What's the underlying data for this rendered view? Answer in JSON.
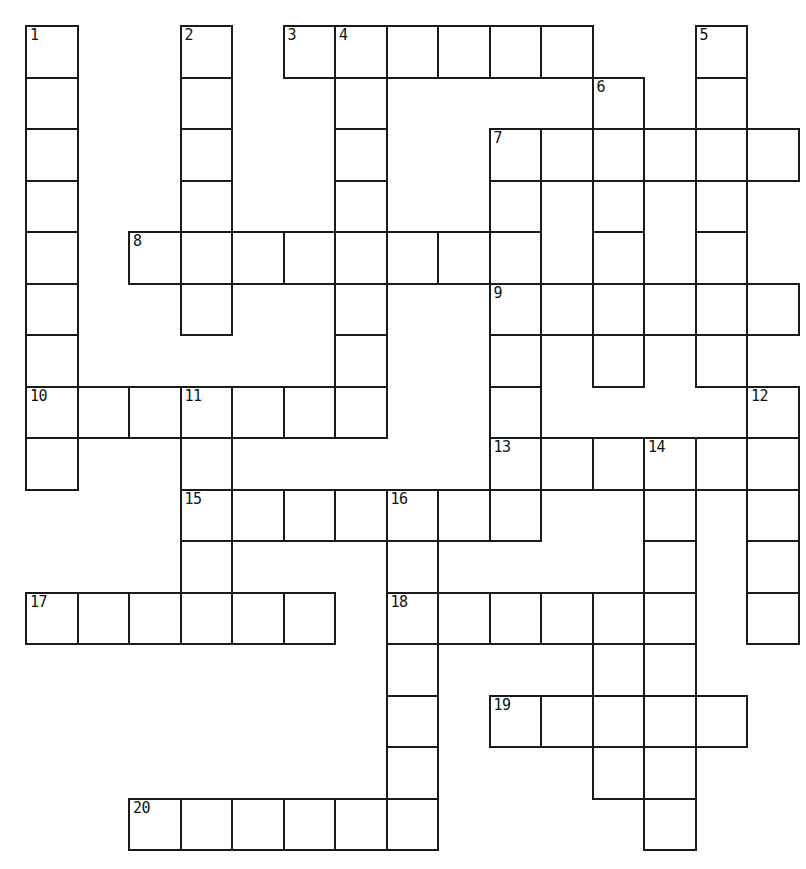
{
  "puzzle": {
    "title": "Crossword Puzzle Grid",
    "type": "crossword-grid",
    "grid": {
      "columns": 15,
      "rows": 16,
      "cell_size_px": 51.5,
      "origin_x_px": 25,
      "origin_y_px": 25,
      "cell_fill_color": "#ffffff",
      "cell_border_color": "#1a1a1a",
      "background_color": "#ffffff",
      "number_color": "#111111"
    },
    "entries": [
      {
        "number": "1",
        "direction": "down",
        "row": 1,
        "col": 1,
        "length": 8
      },
      {
        "number": "2",
        "direction": "down",
        "row": 1,
        "col": 4,
        "length": 7
      },
      {
        "number": "3",
        "direction": "across",
        "row": 1,
        "col": 6,
        "length": 6
      },
      {
        "number": "4",
        "direction": "down",
        "row": 1,
        "col": 7,
        "length": 9
      },
      {
        "number": "5",
        "direction": "down",
        "row": 1,
        "col": 14,
        "length": 8
      },
      {
        "number": "6",
        "direction": "down",
        "row": 2,
        "col": 12,
        "length": 8
      },
      {
        "number": "7",
        "direction": "across",
        "row": 3,
        "col": 10,
        "length": 6
      },
      {
        "number": "8",
        "direction": "across",
        "row": 5,
        "col": 3,
        "length": 7
      },
      {
        "number": "9",
        "direction": "across",
        "row": 6,
        "col": 10,
        "length": 6
      },
      {
        "number": "10",
        "direction": "across",
        "row": 8,
        "col": 1,
        "length": 7
      },
      {
        "number": "11",
        "direction": "down",
        "row": 8,
        "col": 4,
        "length": 6
      },
      {
        "number": "12",
        "direction": "down",
        "row": 8,
        "col": 15,
        "length": 5
      },
      {
        "number": "13",
        "direction": "across",
        "row": 9,
        "col": 10,
        "length": 5
      },
      {
        "number": "14",
        "direction": "down",
        "row": 9,
        "col": 13,
        "length": 8
      },
      {
        "number": "15",
        "direction": "across",
        "row": 10,
        "col": 4,
        "length": 5
      },
      {
        "number": "16",
        "direction": "down",
        "row": 10,
        "col": 8,
        "length": 7
      },
      {
        "number": "17",
        "direction": "across",
        "row": 12,
        "col": 1,
        "length": 6
      },
      {
        "number": "18",
        "direction": "across",
        "row": 12,
        "col": 8,
        "length": 5
      },
      {
        "number": "19",
        "direction": "across",
        "row": 14,
        "col": 10,
        "length": 5
      },
      {
        "number": "20",
        "direction": "across",
        "row": 16,
        "col": 3,
        "length": 6
      }
    ],
    "cells": [
      {
        "row": 1,
        "col": 1,
        "number": "1",
        "letter": ""
      },
      {
        "row": 1,
        "col": 4,
        "number": "2",
        "letter": ""
      },
      {
        "row": 1,
        "col": 6,
        "number": "3",
        "letter": ""
      },
      {
        "row": 1,
        "col": 7,
        "number": "4",
        "letter": ""
      },
      {
        "row": 1,
        "col": 8,
        "number": "",
        "letter": ""
      },
      {
        "row": 1,
        "col": 9,
        "number": "",
        "letter": ""
      },
      {
        "row": 1,
        "col": 10,
        "number": "",
        "letter": ""
      },
      {
        "row": 1,
        "col": 11,
        "number": "",
        "letter": ""
      },
      {
        "row": 1,
        "col": 14,
        "number": "5",
        "letter": ""
      },
      {
        "row": 2,
        "col": 1,
        "number": "",
        "letter": ""
      },
      {
        "row": 2,
        "col": 4,
        "number": "",
        "letter": ""
      },
      {
        "row": 2,
        "col": 7,
        "number": "",
        "letter": ""
      },
      {
        "row": 2,
        "col": 12,
        "number": "6",
        "letter": ""
      },
      {
        "row": 2,
        "col": 14,
        "number": "",
        "letter": ""
      },
      {
        "row": 3,
        "col": 1,
        "number": "",
        "letter": ""
      },
      {
        "row": 3,
        "col": 4,
        "number": "",
        "letter": ""
      },
      {
        "row": 3,
        "col": 7,
        "number": "",
        "letter": ""
      },
      {
        "row": 3,
        "col": 10,
        "number": "7",
        "letter": ""
      },
      {
        "row": 3,
        "col": 11,
        "number": "",
        "letter": ""
      },
      {
        "row": 3,
        "col": 12,
        "number": "",
        "letter": ""
      },
      {
        "row": 3,
        "col": 13,
        "number": "",
        "letter": ""
      },
      {
        "row": 3,
        "col": 14,
        "number": "",
        "letter": ""
      },
      {
        "row": 3,
        "col": 15,
        "number": "",
        "letter": ""
      },
      {
        "row": 4,
        "col": 1,
        "number": "",
        "letter": ""
      },
      {
        "row": 4,
        "col": 4,
        "number": "",
        "letter": ""
      },
      {
        "row": 4,
        "col": 7,
        "number": "",
        "letter": ""
      },
      {
        "row": 4,
        "col": 10,
        "number": "",
        "letter": ""
      },
      {
        "row": 4,
        "col": 12,
        "number": "",
        "letter": ""
      },
      {
        "row": 4,
        "col": 14,
        "number": "",
        "letter": ""
      },
      {
        "row": 5,
        "col": 1,
        "number": "",
        "letter": ""
      },
      {
        "row": 5,
        "col": 3,
        "number": "8",
        "letter": ""
      },
      {
        "row": 5,
        "col": 4,
        "number": "",
        "letter": ""
      },
      {
        "row": 5,
        "col": 5,
        "number": "",
        "letter": ""
      },
      {
        "row": 5,
        "col": 6,
        "number": "",
        "letter": ""
      },
      {
        "row": 5,
        "col": 7,
        "number": "",
        "letter": ""
      },
      {
        "row": 5,
        "col": 8,
        "number": "",
        "letter": ""
      },
      {
        "row": 5,
        "col": 9,
        "number": "",
        "letter": ""
      },
      {
        "row": 5,
        "col": 10,
        "number": "",
        "letter": ""
      },
      {
        "row": 5,
        "col": 12,
        "number": "",
        "letter": ""
      },
      {
        "row": 5,
        "col": 14,
        "number": "",
        "letter": ""
      },
      {
        "row": 6,
        "col": 1,
        "number": "",
        "letter": ""
      },
      {
        "row": 6,
        "col": 4,
        "number": "",
        "letter": ""
      },
      {
        "row": 6,
        "col": 7,
        "number": "",
        "letter": ""
      },
      {
        "row": 6,
        "col": 10,
        "number": "9",
        "letter": ""
      },
      {
        "row": 6,
        "col": 11,
        "number": "",
        "letter": ""
      },
      {
        "row": 6,
        "col": 12,
        "number": "",
        "letter": ""
      },
      {
        "row": 6,
        "col": 13,
        "number": "",
        "letter": ""
      },
      {
        "row": 6,
        "col": 14,
        "number": "",
        "letter": ""
      },
      {
        "row": 6,
        "col": 15,
        "number": "",
        "letter": ""
      },
      {
        "row": 7,
        "col": 1,
        "number": "",
        "letter": ""
      },
      {
        "row": 7,
        "col": 7,
        "number": "",
        "letter": ""
      },
      {
        "row": 7,
        "col": 10,
        "number": "",
        "letter": ""
      },
      {
        "row": 7,
        "col": 12,
        "number": "",
        "letter": ""
      },
      {
        "row": 7,
        "col": 14,
        "number": "",
        "letter": ""
      },
      {
        "row": 8,
        "col": 1,
        "number": "10",
        "letter": ""
      },
      {
        "row": 8,
        "col": 2,
        "number": "",
        "letter": ""
      },
      {
        "row": 8,
        "col": 3,
        "number": "",
        "letter": ""
      },
      {
        "row": 8,
        "col": 4,
        "number": "11",
        "letter": ""
      },
      {
        "row": 8,
        "col": 5,
        "number": "",
        "letter": ""
      },
      {
        "row": 8,
        "col": 6,
        "number": "",
        "letter": ""
      },
      {
        "row": 8,
        "col": 7,
        "number": "",
        "letter": ""
      },
      {
        "row": 8,
        "col": 10,
        "number": "",
        "letter": ""
      },
      {
        "row": 8,
        "col": 15,
        "number": "12",
        "letter": ""
      },
      {
        "row": 9,
        "col": 1,
        "number": "",
        "letter": ""
      },
      {
        "row": 9,
        "col": 4,
        "number": "",
        "letter": ""
      },
      {
        "row": 9,
        "col": 10,
        "number": "13",
        "letter": ""
      },
      {
        "row": 9,
        "col": 11,
        "number": "",
        "letter": ""
      },
      {
        "row": 9,
        "col": 12,
        "number": "",
        "letter": ""
      },
      {
        "row": 9,
        "col": 13,
        "number": "14",
        "letter": ""
      },
      {
        "row": 9,
        "col": 14,
        "number": "",
        "letter": ""
      },
      {
        "row": 9,
        "col": 15,
        "number": "",
        "letter": ""
      },
      {
        "row": 10,
        "col": 4,
        "number": "15",
        "letter": ""
      },
      {
        "row": 10,
        "col": 5,
        "number": "",
        "letter": ""
      },
      {
        "row": 10,
        "col": 6,
        "number": "",
        "letter": ""
      },
      {
        "row": 10,
        "col": 7,
        "number": "",
        "letter": ""
      },
      {
        "row": 10,
        "col": 8,
        "number": "16",
        "letter": ""
      },
      {
        "row": 10,
        "col": 9,
        "number": "",
        "letter": ""
      },
      {
        "row": 10,
        "col": 10,
        "number": "",
        "letter": ""
      },
      {
        "row": 10,
        "col": 13,
        "number": "",
        "letter": ""
      },
      {
        "row": 10,
        "col": 15,
        "number": "",
        "letter": ""
      },
      {
        "row": 11,
        "col": 4,
        "number": "",
        "letter": ""
      },
      {
        "row": 11,
        "col": 8,
        "number": "",
        "letter": ""
      },
      {
        "row": 11,
        "col": 13,
        "number": "",
        "letter": ""
      },
      {
        "row": 11,
        "col": 15,
        "number": "",
        "letter": ""
      },
      {
        "row": 12,
        "col": 1,
        "number": "17",
        "letter": ""
      },
      {
        "row": 12,
        "col": 2,
        "number": "",
        "letter": ""
      },
      {
        "row": 12,
        "col": 3,
        "number": "",
        "letter": ""
      },
      {
        "row": 12,
        "col": 4,
        "number": "",
        "letter": ""
      },
      {
        "row": 12,
        "col": 5,
        "number": "",
        "letter": ""
      },
      {
        "row": 12,
        "col": 6,
        "number": "",
        "letter": ""
      },
      {
        "row": 12,
        "col": 8,
        "number": "18",
        "letter": ""
      },
      {
        "row": 12,
        "col": 9,
        "number": "",
        "letter": ""
      },
      {
        "row": 12,
        "col": 10,
        "number": "",
        "letter": ""
      },
      {
        "row": 12,
        "col": 11,
        "number": "",
        "letter": ""
      },
      {
        "row": 12,
        "col": 12,
        "number": "",
        "letter": ""
      },
      {
        "row": 12,
        "col": 13,
        "number": "",
        "letter": ""
      },
      {
        "row": 12,
        "col": 15,
        "number": "",
        "letter": ""
      },
      {
        "row": 13,
        "col": 8,
        "number": "",
        "letter": ""
      },
      {
        "row": 13,
        "col": 12,
        "number": "",
        "letter": ""
      },
      {
        "row": 13,
        "col": 13,
        "number": "",
        "letter": ""
      },
      {
        "row": 14,
        "col": 8,
        "number": "",
        "letter": ""
      },
      {
        "row": 14,
        "col": 10,
        "number": "19",
        "letter": ""
      },
      {
        "row": 14,
        "col": 11,
        "number": "",
        "letter": ""
      },
      {
        "row": 14,
        "col": 12,
        "number": "",
        "letter": ""
      },
      {
        "row": 14,
        "col": 13,
        "number": "",
        "letter": ""
      },
      {
        "row": 14,
        "col": 14,
        "number": "",
        "letter": ""
      },
      {
        "row": 15,
        "col": 8,
        "number": "",
        "letter": ""
      },
      {
        "row": 15,
        "col": 12,
        "number": "",
        "letter": ""
      },
      {
        "row": 15,
        "col": 13,
        "number": "",
        "letter": ""
      },
      {
        "row": 16,
        "col": 3,
        "number": "20",
        "letter": ""
      },
      {
        "row": 16,
        "col": 4,
        "number": "",
        "letter": ""
      },
      {
        "row": 16,
        "col": 5,
        "number": "",
        "letter": ""
      },
      {
        "row": 16,
        "col": 6,
        "number": "",
        "letter": ""
      },
      {
        "row": 16,
        "col": 7,
        "number": "",
        "letter": ""
      },
      {
        "row": 16,
        "col": 8,
        "number": "",
        "letter": ""
      },
      {
        "row": 16,
        "col": 13,
        "number": "",
        "letter": ""
      }
    ]
  }
}
